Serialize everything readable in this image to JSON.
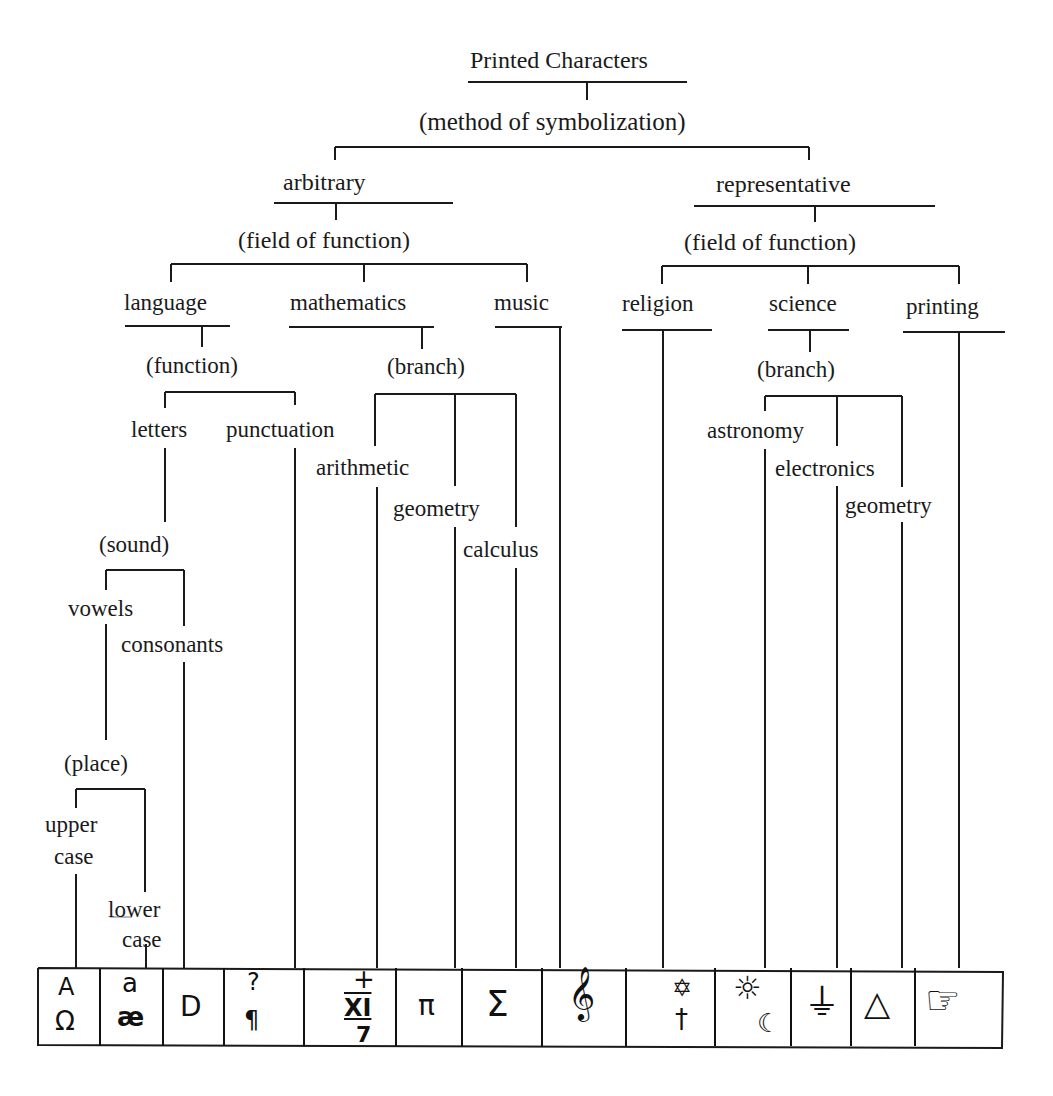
{
  "diagram": {
    "title": "Printed Characters",
    "nodes": {
      "method": "(method of symbolization)",
      "arbitrary": "arbitrary",
      "representative": "representative",
      "field_left": "(field of function)",
      "field_right": "(field of function)",
      "language": "language",
      "mathematics": "mathematics",
      "music": "music",
      "religion": "religion",
      "science": "science",
      "printing": "printing",
      "function": "(function)",
      "branch_math": "(branch)",
      "branch_sci": "(branch)",
      "letters": "letters",
      "punctuation": "punctuation",
      "arithmetic": "arithmetic",
      "geometry_math": "geometry",
      "calculus": "calculus",
      "astronomy": "astronomy",
      "electronics": "electronics",
      "geometry_sci": "geometry",
      "sound": "(sound)",
      "vowels": "vowels",
      "consonants": "consonants",
      "place": "(place)",
      "upper": "upper",
      "upper_case": "case",
      "lower": "lower",
      "lower_case": "case"
    },
    "symbols": [
      {
        "name": "upper-case-letters",
        "glyphs": [
          "A",
          "Ω"
        ]
      },
      {
        "name": "lower-case-letters",
        "glyphs": [
          "a",
          "æ"
        ]
      },
      {
        "name": "consonant",
        "glyphs": [
          "D"
        ]
      },
      {
        "name": "punctuation",
        "glyphs": [
          "?",
          "¶"
        ]
      },
      {
        "name": "arithmetic",
        "glyphs": [
          "+",
          "XI",
          "7"
        ]
      },
      {
        "name": "geometry-pi",
        "glyphs": [
          "π"
        ]
      },
      {
        "name": "calculus-sigma",
        "glyphs": [
          "Σ"
        ]
      },
      {
        "name": "music-treble-clef",
        "glyphs": [
          "𝄞"
        ]
      },
      {
        "name": "religion",
        "glyphs": [
          "✡",
          "†"
        ]
      },
      {
        "name": "astronomy",
        "glyphs": [
          "☼",
          "☾"
        ]
      },
      {
        "name": "electronics",
        "glyphs": [
          "⏚"
        ]
      },
      {
        "name": "geometry-triangle",
        "glyphs": [
          "△"
        ]
      },
      {
        "name": "printing-pointing-hand",
        "glyphs": [
          "☞"
        ]
      }
    ]
  }
}
